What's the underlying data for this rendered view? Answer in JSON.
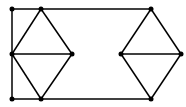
{
  "diagram": {
    "type": "graph",
    "background": "#ffffff",
    "stroke_color": "#000000",
    "stroke_width": 1.5,
    "vertex_radius": 2.5,
    "vertices": [
      {
        "id": "v1",
        "x": 12,
        "y": 9
      },
      {
        "id": "v2",
        "x": 41,
        "y": 9
      },
      {
        "id": "v3",
        "x": 12,
        "y": 54
      },
      {
        "id": "v4",
        "x": 72,
        "y": 54
      },
      {
        "id": "v5",
        "x": 12,
        "y": 99
      },
      {
        "id": "v6",
        "x": 41,
        "y": 99
      },
      {
        "id": "v7",
        "x": 151,
        "y": 9
      },
      {
        "id": "v8",
        "x": 121,
        "y": 54
      },
      {
        "id": "v9",
        "x": 181,
        "y": 54
      },
      {
        "id": "v10",
        "x": 151,
        "y": 99
      }
    ],
    "edges": [
      [
        "v1",
        "v2"
      ],
      [
        "v2",
        "v7"
      ],
      [
        "v1",
        "v3"
      ],
      [
        "v3",
        "v5"
      ],
      [
        "v5",
        "v6"
      ],
      [
        "v6",
        "v10"
      ],
      [
        "v2",
        "v3"
      ],
      [
        "v2",
        "v4"
      ],
      [
        "v3",
        "v4"
      ],
      [
        "v3",
        "v6"
      ],
      [
        "v4",
        "v6"
      ],
      [
        "v7",
        "v8"
      ],
      [
        "v7",
        "v9"
      ],
      [
        "v8",
        "v9"
      ],
      [
        "v8",
        "v10"
      ],
      [
        "v9",
        "v10"
      ]
    ]
  }
}
